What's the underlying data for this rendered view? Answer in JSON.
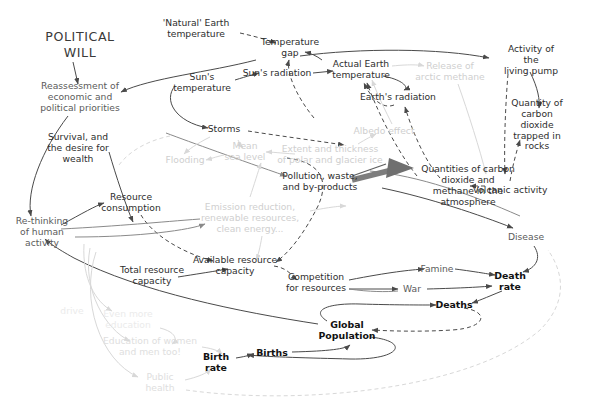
{
  "diagram": {
    "background": "#ffffff",
    "colors": {
      "dark_text": "#2e2e2e",
      "mid_text": "#5b5b5b",
      "bold_text": "#111111",
      "faint_text": "#cfcfcf",
      "ghost_text": "#ebebeb",
      "dark_link": "#4a4a4a",
      "mid_link": "#8a8a8a",
      "faint_link": "#d8d8d8",
      "thick_arrow": "#7d7d7d"
    },
    "heading": "POLITICAL\nWILL",
    "nodes": [
      {
        "id": "political-will",
        "label": "POLITICAL\nWILL",
        "style": "title",
        "x": 80,
        "y": 45
      },
      {
        "id": "reassessment",
        "label": "Reassessment of\neconomic and\npolitical priorities",
        "style": "mid",
        "x": 80,
        "y": 97
      },
      {
        "id": "survival-desire",
        "label": "Survival, and\nthe desire for\nwealth",
        "style": "dark",
        "x": 78,
        "y": 148
      },
      {
        "id": "rethinking-human",
        "label": "Re-thinking\nof human\nactivity",
        "style": "mid",
        "x": 42,
        "y": 232
      },
      {
        "id": "natural-earth-temp",
        "label": "'Natural' Earth\ntemperature",
        "style": "dark",
        "x": 196,
        "y": 29
      },
      {
        "id": "temperature-gap",
        "label": "Temperature\ngap",
        "style": "dark",
        "x": 290,
        "y": 48
      },
      {
        "id": "suns-temperature",
        "label": "Sun's\ntemperature",
        "style": "dark",
        "x": 202,
        "y": 83
      },
      {
        "id": "suns-radiation",
        "label": "Sun's radiation",
        "style": "dark",
        "x": 277,
        "y": 73
      },
      {
        "id": "actual-earth-temp",
        "label": "Actual Earth\ntemperature",
        "style": "dark",
        "x": 361,
        "y": 70
      },
      {
        "id": "release-arctic-methane",
        "label": "Release  of\narctic methane",
        "style": "faint",
        "x": 450,
        "y": 72
      },
      {
        "id": "activity-living-pump",
        "label": "Activity of the\nliving pump",
        "style": "dark",
        "x": 531,
        "y": 60
      },
      {
        "id": "earths-radiation",
        "label": "Earth's radiation",
        "style": "dark",
        "x": 398,
        "y": 97
      },
      {
        "id": "albedo-effect",
        "label": "Albedo effect",
        "style": "faint",
        "x": 384,
        "y": 131
      },
      {
        "id": "co2-rocks",
        "label": "Quantity of\ncarbon dioxide\ntrapped in rocks",
        "style": "dark",
        "x": 537,
        "y": 125
      },
      {
        "id": "storms",
        "label": "Storms",
        "style": "dark",
        "x": 224,
        "y": 129
      },
      {
        "id": "mean-sea-level",
        "label": "Mean\nsea level",
        "style": "faint",
        "x": 245,
        "y": 152
      },
      {
        "id": "flooding",
        "label": "Flooding",
        "style": "faint",
        "x": 185,
        "y": 160
      },
      {
        "id": "polar-glacier-ice",
        "label": "Extent and thickness\nof polar and glacier ice",
        "style": "faint",
        "x": 330,
        "y": 155
      },
      {
        "id": "co2-methane-atmosphere",
        "label": "Quantities of carbon dioxide and\nmethane in the atmosphere",
        "style": "dark",
        "x": 468,
        "y": 186
      },
      {
        "id": "volcanic-activity",
        "label": "Volcanic activity",
        "style": "dark",
        "x": 510,
        "y": 190
      },
      {
        "id": "pollution-waste",
        "label": "Pollution, waste,\nand by-products",
        "style": "dark",
        "x": 320,
        "y": 182
      },
      {
        "id": "resource-consumption",
        "label": "Resource\nconsumption",
        "style": "dark",
        "x": 131,
        "y": 203
      },
      {
        "id": "emission-reduction",
        "label": "Emission reduction,\nrenewable resources,\nclean energy...",
        "style": "faint",
        "x": 250,
        "y": 218
      },
      {
        "id": "available-resource-cap",
        "label": "Available resource\ncapacity",
        "style": "dark",
        "x": 235,
        "y": 266
      },
      {
        "id": "total-resource-cap",
        "label": "Total resource\ncapacity",
        "style": "dark",
        "x": 152,
        "y": 276
      },
      {
        "id": "competition-resources",
        "label": "Competition\nfor resources",
        "style": "dark",
        "x": 316,
        "y": 283
      },
      {
        "id": "famine",
        "label": "Famine",
        "style": "mid",
        "x": 437,
        "y": 269
      },
      {
        "id": "war",
        "label": "War",
        "style": "mid",
        "x": 412,
        "y": 289
      },
      {
        "id": "disease",
        "label": "Disease",
        "style": "mid",
        "x": 526,
        "y": 237
      },
      {
        "id": "death-rate",
        "label": "Death\nrate",
        "style": "bold",
        "x": 510,
        "y": 281
      },
      {
        "id": "deaths",
        "label": "Deaths",
        "style": "bold",
        "x": 454,
        "y": 305
      },
      {
        "id": "global-population",
        "label": "Global\nPopulation",
        "style": "bold",
        "x": 347,
        "y": 330
      },
      {
        "id": "births",
        "label": "Births",
        "style": "bold",
        "x": 272,
        "y": 353
      },
      {
        "id": "birth-rate",
        "label": "Birth\nrate",
        "style": "bold",
        "x": 216,
        "y": 362
      },
      {
        "id": "drive",
        "label": "drive",
        "style": "ghost",
        "x": 72,
        "y": 311
      },
      {
        "id": "even-more-education",
        "label": "Even more\neducation",
        "style": "ghost",
        "x": 128,
        "y": 320
      },
      {
        "id": "education-women-men",
        "label": "Education of women\nand men too!",
        "style": "faint2",
        "x": 150,
        "y": 347
      },
      {
        "id": "public-health",
        "label": "Public\nhealth",
        "style": "faint2",
        "x": 160,
        "y": 383
      }
    ],
    "edges": [
      {
        "from": "political-will",
        "to": "reassessment",
        "style": "solid"
      },
      {
        "from": "temperature-gap",
        "to": "reassessment",
        "style": "solid"
      },
      {
        "from": "natural-earth-temp",
        "to": "temperature-gap",
        "style": "dashed"
      },
      {
        "from": "actual-earth-temp",
        "to": "temperature-gap",
        "style": "solid"
      },
      {
        "from": "suns-temperature",
        "to": "suns-radiation",
        "style": "solid"
      },
      {
        "from": "suns-radiation",
        "to": "actual-earth-temp",
        "style": "solid"
      },
      {
        "from": "suns-temperature",
        "to": "storms",
        "style": "solid"
      },
      {
        "from": "actual-earth-temp",
        "to": "activity-living-pump",
        "style": "solid"
      },
      {
        "from": "actual-earth-temp",
        "to": "earths-radiation",
        "style": "solid"
      },
      {
        "from": "earths-radiation",
        "to": "actual-earth-temp",
        "style": "dashed"
      },
      {
        "from": "co2-methane-atmosphere",
        "to": "earths-radiation",
        "style": "dashed"
      },
      {
        "from": "co2-methane-atmosphere",
        "to": "actual-earth-temp",
        "style": "dashed"
      },
      {
        "from": "activity-living-pump",
        "to": "co2-methane-atmosphere",
        "style": "dashed"
      },
      {
        "from": "activity-living-pump",
        "to": "co2-rocks",
        "style": "solid"
      },
      {
        "from": "volcanic-activity",
        "to": "co2-methane-atmosphere",
        "style": "dashed"
      },
      {
        "from": "volcanic-activity",
        "to": "co2-rocks",
        "style": "dashed"
      },
      {
        "from": "pollution-waste",
        "to": "co2-methane-atmosphere",
        "style": "thick"
      },
      {
        "from": "storms",
        "to": "polar-glacier-ice",
        "style": "dashed"
      },
      {
        "from": "mean-sea-level",
        "to": "flooding",
        "style": "faint"
      },
      {
        "from": "polar-glacier-ice",
        "to": "mean-sea-level",
        "style": "faint"
      },
      {
        "from": "albedo-effect",
        "to": "actual-earth-temp",
        "style": "faint"
      },
      {
        "from": "release-arctic-methane",
        "to": "co2-methane-atmosphere",
        "style": "faint"
      },
      {
        "from": "resource-consumption",
        "to": "pollution-waste",
        "style": "solid"
      },
      {
        "from": "resource-consumption",
        "to": "available-resource-cap",
        "style": "dashed"
      },
      {
        "from": "rethinking-human",
        "to": "resource-consumption",
        "style": "solid"
      },
      {
        "from": "rethinking-human",
        "to": "emission-reduction",
        "style": "faint"
      },
      {
        "from": "emission-reduction",
        "to": "available-resource-cap",
        "style": "faint"
      },
      {
        "from": "total-resource-cap",
        "to": "available-resource-cap",
        "style": "solid"
      },
      {
        "from": "available-resource-cap",
        "to": "competition-resources",
        "style": "dashed"
      },
      {
        "from": "competition-resources",
        "to": "famine",
        "style": "solid"
      },
      {
        "from": "competition-resources",
        "to": "war",
        "style": "solid"
      },
      {
        "from": "famine",
        "to": "death-rate",
        "style": "solid"
      },
      {
        "from": "war",
        "to": "death-rate",
        "style": "solid"
      },
      {
        "from": "disease",
        "to": "death-rate",
        "style": "solid"
      },
      {
        "from": "co2-methane-atmosphere",
        "to": "disease",
        "style": "solid"
      },
      {
        "from": "death-rate",
        "to": "deaths",
        "style": "solid"
      },
      {
        "from": "global-population",
        "to": "deaths",
        "style": "solid"
      },
      {
        "from": "deaths",
        "to": "global-population",
        "style": "dashed"
      },
      {
        "from": "births",
        "to": "global-population",
        "style": "solid"
      },
      {
        "from": "global-population",
        "to": "births",
        "style": "solid"
      },
      {
        "from": "birth-rate",
        "to": "births",
        "style": "solid"
      },
      {
        "from": "global-population",
        "to": "rethinking-human",
        "style": "solid"
      },
      {
        "from": "public-health",
        "to": "birth-rate",
        "style": "faint"
      },
      {
        "from": "education-women-men",
        "to": "birth-rate",
        "style": "faint"
      },
      {
        "from": "even-more-education",
        "to": "education-women-men",
        "style": "faint"
      }
    ]
  }
}
